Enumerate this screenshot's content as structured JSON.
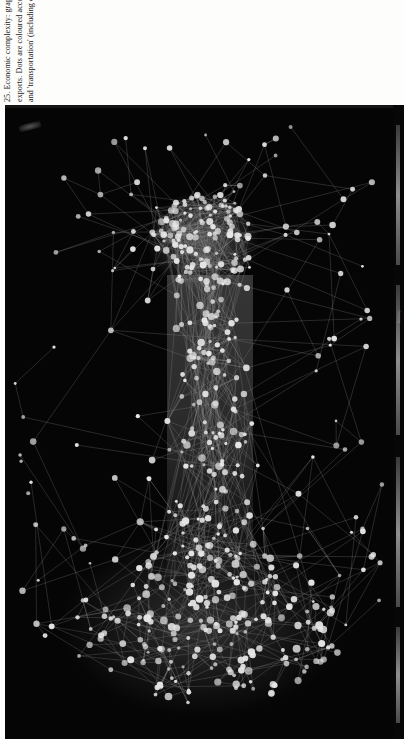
{
  "page": {
    "background_color": "#fdfdfb",
    "figure_background_color": "#050505",
    "node_color": "#e8e8e8",
    "edge_color": "#9a9a9a"
  },
  "caption": {
    "number": "25.",
    "text": "25. Economic complexity: graph of the global 'product space', in which each dot represents a million dollars' worth of exports. Dots are coloured according to product type. The central component is dominated by 'machinery and electrical' and 'transportation' (including cars); the right-hand cluster is the textile, footwear, and headgear industry.",
    "lines": [
      "25. Economic comp",
      "graph of the global",
      "'product space', in",
      "each dot represents",
      "million dollars' wo",
      "exports. Dots are c",
      "according to produ",
      "The central compo",
      "dominated by 'mac",
      "and electrical' and",
      "'transportation' (in",
      "cars); the right-han",
      "is the textile, footw",
      "headgear industry."
    ],
    "clipped_right_edge": true,
    "rotation_degrees": -90
  },
  "figure": {
    "type": "network-graph",
    "legend_strip": {
      "visible": true,
      "labels": [
        "Machinery",
        "Textile"
      ],
      "legible": false
    }
  },
  "chart_data": {
    "type": "scatter",
    "xlabel": "",
    "ylabel": "",
    "legend_position": "right-strip",
    "grid": false,
    "background": "#050505",
    "node_fill": "#e6e6e6",
    "edge_stroke": "#8f8f8f",
    "clusters": [
      {
        "name": "machinery-and-electrical core",
        "approx_nodes": 120,
        "center": [
          198,
          135
        ],
        "radius": 52
      },
      {
        "name": "transportation spine",
        "approx_nodes": 150,
        "center": [
          205,
          330
        ],
        "radius": 70
      },
      {
        "name": "textile-footwear-headgear",
        "approx_nodes": 180,
        "center": [
          200,
          520
        ],
        "radius": 130
      },
      {
        "name": "peripheral-sparse",
        "approx_nodes": 140,
        "center": [
          200,
          300
        ],
        "radius": 190
      }
    ],
    "total_nodes_estimate": 590,
    "total_edges_estimate": 900
  }
}
